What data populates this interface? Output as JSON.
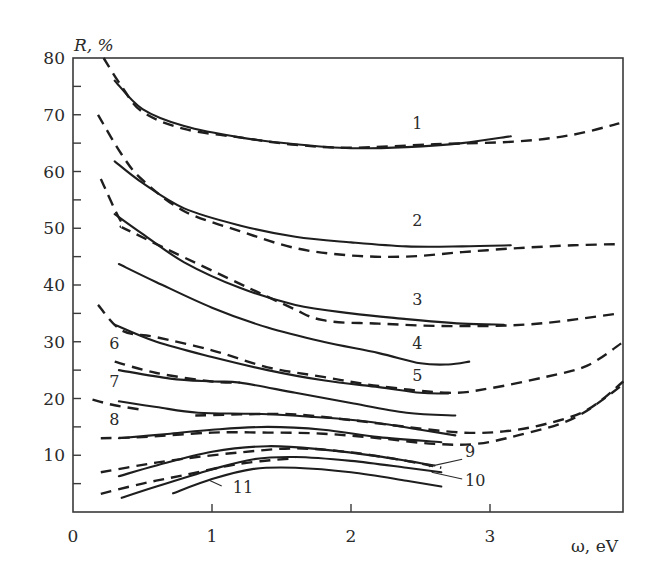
{
  "chart_data": {
    "type": "line",
    "title": "",
    "xlabel": "ω, eV",
    "ylabel": "R, %",
    "xlim": [
      0,
      3.96
    ],
    "ylim": [
      0,
      80
    ],
    "grid": false,
    "legend": "none (curves numbered 1–11 directly on plot)",
    "x_ticks": [
      0,
      1,
      2,
      3
    ],
    "y_ticks": [
      10,
      20,
      30,
      40,
      50,
      60,
      70,
      80
    ],
    "y_minor_ticks": [
      5,
      15,
      25,
      35,
      45,
      55,
      65,
      75
    ],
    "series": [
      {
        "name": "1",
        "style": "solid",
        "points": [
          [
            0.3,
            76
          ],
          [
            0.5,
            71
          ],
          [
            0.8,
            68
          ],
          [
            1.2,
            66
          ],
          [
            1.6,
            64.8
          ],
          [
            2.0,
            64.1
          ],
          [
            2.4,
            64.3
          ],
          [
            2.8,
            65
          ],
          [
            3.15,
            66.2
          ]
        ]
      },
      {
        "name": "1",
        "style": "dashed",
        "points": [
          [
            0.22,
            80
          ],
          [
            0.35,
            75
          ],
          [
            0.5,
            70.5
          ],
          [
            0.8,
            67.5
          ],
          [
            1.2,
            66
          ],
          [
            1.6,
            64.7
          ],
          [
            2.0,
            64.2
          ],
          [
            2.6,
            64.8
          ],
          [
            3.2,
            65.3
          ],
          [
            3.6,
            66.5
          ],
          [
            3.93,
            68.5
          ]
        ]
      },
      {
        "name": "2",
        "style": "solid",
        "points": [
          [
            0.3,
            61.8
          ],
          [
            0.5,
            58
          ],
          [
            0.8,
            53.5
          ],
          [
            1.2,
            50.5
          ],
          [
            1.6,
            48.5
          ],
          [
            2.0,
            47.5
          ],
          [
            2.4,
            46.8
          ],
          [
            2.8,
            46.8
          ],
          [
            3.15,
            47
          ]
        ]
      },
      {
        "name": "2",
        "style": "dashed",
        "points": [
          [
            0.18,
            70
          ],
          [
            0.35,
            63
          ],
          [
            0.5,
            58.5
          ],
          [
            0.8,
            53
          ],
          [
            1.2,
            49.5
          ],
          [
            1.6,
            46.5
          ],
          [
            2.0,
            45.2
          ],
          [
            2.4,
            45
          ],
          [
            2.8,
            45.8
          ],
          [
            3.2,
            46.5
          ],
          [
            3.6,
            47
          ],
          [
            3.93,
            47.2
          ]
        ]
      },
      {
        "name": "3",
        "style": "solid",
        "points": [
          [
            0.3,
            52.5
          ],
          [
            0.5,
            49
          ],
          [
            0.8,
            44
          ],
          [
            1.2,
            39.5
          ],
          [
            1.6,
            36.5
          ],
          [
            2.0,
            35
          ],
          [
            2.4,
            34
          ],
          [
            2.8,
            33.2
          ],
          [
            3.1,
            33
          ]
        ]
      },
      {
        "name": "3",
        "style": "dashed",
        "points": [
          [
            0.2,
            58.7
          ],
          [
            0.35,
            51
          ],
          [
            0.45,
            49
          ],
          [
            1.5,
            36.8
          ],
          [
            1.8,
            33.8
          ],
          [
            2.2,
            33.2
          ],
          [
            2.6,
            32.8
          ],
          [
            3.0,
            32.8
          ],
          [
            3.4,
            33.3
          ],
          [
            3.93,
            35
          ]
        ]
      },
      {
        "name": "4",
        "style": "solid",
        "points": [
          [
            0.33,
            43.7
          ],
          [
            0.6,
            40.5
          ],
          [
            1.0,
            36
          ],
          [
            1.4,
            32.5
          ],
          [
            1.8,
            30
          ],
          [
            2.2,
            28
          ],
          [
            2.5,
            26.2
          ],
          [
            2.7,
            26
          ],
          [
            2.85,
            26.5
          ]
        ]
      },
      {
        "name": "5",
        "style": "solid",
        "points": [
          [
            0.3,
            33
          ],
          [
            0.6,
            30
          ],
          [
            1.0,
            27.3
          ],
          [
            1.4,
            25
          ],
          [
            1.8,
            23.2
          ],
          [
            2.2,
            22
          ],
          [
            2.5,
            21
          ],
          [
            2.7,
            20.9
          ]
        ]
      },
      {
        "name": "5",
        "style": "dashed",
        "points": [
          [
            0.18,
            36.5
          ],
          [
            0.35,
            32
          ],
          [
            0.6,
            30.8
          ],
          [
            1.0,
            28.5
          ],
          [
            1.4,
            25.5
          ],
          [
            1.8,
            23.8
          ],
          [
            2.2,
            22.2
          ],
          [
            2.7,
            21
          ],
          [
            3.0,
            21.8
          ],
          [
            3.4,
            23.8
          ],
          [
            3.7,
            25.8
          ],
          [
            3.96,
            30
          ]
        ]
      },
      {
        "name": "6",
        "style": "solid",
        "points": [
          [
            0.33,
            25
          ],
          [
            0.7,
            23.5
          ],
          [
            1.0,
            23
          ],
          [
            1.2,
            22.8
          ],
          [
            1.6,
            21
          ],
          [
            2.0,
            19.2
          ],
          [
            2.4,
            17.5
          ],
          [
            2.75,
            17
          ]
        ]
      },
      {
        "name": "6",
        "style": "dashed",
        "points": [
          [
            0.3,
            26.5
          ],
          [
            0.6,
            24.5
          ],
          [
            1.0,
            23
          ],
          [
            1.2,
            22.8
          ]
        ]
      },
      {
        "name": "7",
        "style": "solid",
        "points": [
          [
            0.33,
            19.5
          ],
          [
            0.6,
            18.5
          ],
          [
            0.9,
            17.5
          ],
          [
            1.3,
            17.3
          ],
          [
            1.7,
            16.8
          ],
          [
            2.1,
            16
          ],
          [
            2.5,
            14.5
          ],
          [
            2.75,
            13.5
          ]
        ]
      },
      {
        "name": "7",
        "style": "dashed",
        "points": [
          [
            0.14,
            19.8
          ],
          [
            0.3,
            18.8
          ],
          [
            0.5,
            18
          ]
        ]
      },
      {
        "name": "7",
        "style": "dashed",
        "points": [
          [
            0.88,
            17
          ],
          [
            1.2,
            17.2
          ],
          [
            1.6,
            17.2
          ],
          [
            2.0,
            16.2
          ],
          [
            2.4,
            15
          ],
          [
            2.8,
            14
          ],
          [
            3.1,
            14.2
          ],
          [
            3.4,
            15.5
          ],
          [
            3.7,
            18
          ],
          [
            3.96,
            23
          ]
        ]
      },
      {
        "name": "8",
        "style": "solid",
        "points": [
          [
            0.33,
            13
          ],
          [
            0.7,
            13.8
          ],
          [
            1.0,
            14.5
          ],
          [
            1.4,
            15
          ],
          [
            1.8,
            14.5
          ],
          [
            2.2,
            13.2
          ],
          [
            2.65,
            12.3
          ]
        ]
      },
      {
        "name": "8",
        "style": "dashed",
        "points": [
          [
            0.2,
            13
          ],
          [
            0.5,
            13.2
          ],
          [
            1.0,
            14
          ],
          [
            1.4,
            14
          ],
          [
            1.8,
            13.8
          ],
          [
            2.2,
            13
          ],
          [
            2.6,
            12
          ],
          [
            2.9,
            12
          ],
          [
            3.2,
            13.5
          ],
          [
            3.6,
            16.5
          ],
          [
            3.96,
            22.5
          ]
        ]
      },
      {
        "name": "9",
        "style": "solid",
        "points": [
          [
            0.33,
            6.3
          ],
          [
            0.6,
            8.2
          ],
          [
            1.0,
            10.6
          ],
          [
            1.4,
            11.6
          ],
          [
            1.8,
            11
          ],
          [
            2.2,
            9.8
          ],
          [
            2.6,
            8.2
          ]
        ]
      },
      {
        "name": "9",
        "style": "dashed",
        "points": [
          [
            0.2,
            7
          ],
          [
            0.5,
            8.3
          ],
          [
            0.8,
            9.4
          ],
          [
            1.2,
            10.5
          ],
          [
            1.6,
            11.2
          ],
          [
            2.0,
            10.5
          ],
          [
            2.4,
            9
          ],
          [
            2.65,
            7.8
          ]
        ]
      },
      {
        "name": "10",
        "style": "solid",
        "points": [
          [
            0.35,
            2.5
          ],
          [
            0.6,
            4.5
          ],
          [
            1.0,
            7.5
          ],
          [
            1.3,
            9.3
          ],
          [
            1.6,
            9.7
          ],
          [
            2.0,
            9
          ],
          [
            2.4,
            7.8
          ],
          [
            2.65,
            7
          ]
        ]
      },
      {
        "name": "10",
        "style": "dashed",
        "points": [
          [
            0.2,
            3.2
          ],
          [
            0.5,
            5
          ],
          [
            0.8,
            6.5
          ],
          [
            1.2,
            8.5
          ],
          [
            1.6,
            9.5
          ]
        ]
      },
      {
        "name": "11",
        "style": "solid",
        "points": [
          [
            0.72,
            3.3
          ],
          [
            1.0,
            5.8
          ],
          [
            1.3,
            7.6
          ],
          [
            1.6,
            7.8
          ],
          [
            2.0,
            7
          ],
          [
            2.4,
            5.5
          ],
          [
            2.65,
            4.5
          ]
        ]
      }
    ],
    "curve_labels": [
      {
        "text": "1",
        "x": 2.44,
        "y": 67.5
      },
      {
        "text": "2",
        "x": 2.44,
        "y": 50.4
      },
      {
        "text": "3",
        "x": 2.44,
        "y": 36.5
      },
      {
        "text": "4",
        "x": 2.44,
        "y": 28.7
      },
      {
        "text": "5",
        "x": 2.44,
        "y": 23.1
      },
      {
        "text": "6",
        "x": 0.26,
        "y": 28.8
      },
      {
        "text": "7",
        "x": 0.26,
        "y": 22
      },
      {
        "text": "8",
        "x": 0.26,
        "y": 15.3
      },
      {
        "text": "9",
        "x": 2.82,
        "y": 9.7
      },
      {
        "text": "10",
        "x": 2.82,
        "y": 4.6
      },
      {
        "text": "11",
        "x": 1.15,
        "y": 3.4
      }
    ],
    "leader_lines": [
      {
        "for": "9",
        "from": [
          2.8,
          9.3
        ],
        "to": [
          2.56,
          8.0
        ]
      },
      {
        "for": "10",
        "from": [
          2.8,
          5.8
        ],
        "to": [
          2.58,
          7.0
        ]
      },
      {
        "for": "11",
        "from": [
          1.07,
          4.6
        ],
        "to": [
          0.98,
          5.6
        ]
      }
    ]
  },
  "axes": {
    "x_title": "ω, eV",
    "y_title": "R, %",
    "x_tick_labels": [
      "0",
      "1",
      "2",
      "3"
    ],
    "y_tick_labels": [
      "80",
      "70",
      "60",
      "50",
      "40",
      "30",
      "20",
      "10"
    ]
  }
}
